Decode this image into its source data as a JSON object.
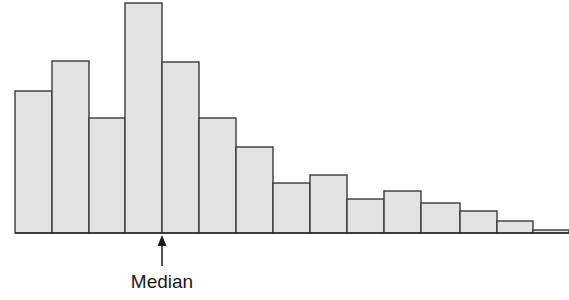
{
  "figure": {
    "kind": "histogram-figure",
    "background_color": "#ffffff",
    "width": 569,
    "height": 300
  },
  "annotation": {
    "label": "Median",
    "icon": "up-arrow-icon",
    "arrow_x": 162,
    "arrow_tip_y": 236,
    "arrow_tail_y": 266,
    "label_x": 162,
    "label_y": 288,
    "color": "#1a1a1a"
  },
  "axis": {
    "baseline_y": 233,
    "x_start": 15,
    "x_end": 569,
    "color": "#2b2b2b",
    "tick_labels": [],
    "y_tick_labels": []
  },
  "style": {
    "bar_fill": "#e3e3e3",
    "bar_stroke": "#3a3a3a",
    "bar_stroke_width": 1.4
  },
  "chart_data": {
    "type": "bar",
    "title": "",
    "subtitle": "",
    "xlabel": "",
    "ylabel": "",
    "grid": false,
    "legend": [],
    "legend_position": "none",
    "orientation": "vertical",
    "bin_count": 15,
    "shape_description": "right-skewed unimodal histogram with median marked left of center",
    "categories": [
      "1",
      "2",
      "3",
      "4",
      "5",
      "6",
      "7",
      "8",
      "9",
      "10",
      "11",
      "12",
      "13",
      "14",
      "15"
    ],
    "values": [
      142,
      172,
      115,
      230,
      171,
      115,
      86,
      50,
      58,
      34,
      42,
      30,
      22,
      12,
      3
    ],
    "ylim": [
      0,
      233
    ],
    "xlim": [
      0,
      15
    ],
    "bar_edges_px": [
      15,
      52,
      89,
      125,
      162,
      199,
      236,
      273,
      310,
      347,
      384,
      421,
      460,
      497,
      533,
      569
    ],
    "bar_top_px": [
      91,
      61,
      118,
      3,
      62,
      118,
      147,
      183,
      175,
      199,
      191,
      203,
      211,
      221,
      230
    ],
    "annotations": [
      {
        "text": "Median",
        "x_px": 162,
        "type": "arrow-pointer"
      }
    ]
  }
}
